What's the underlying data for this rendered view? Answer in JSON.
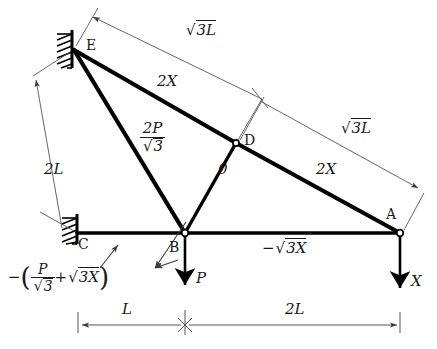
{
  "figure": {
    "type": "truss-free-body-diagram",
    "background": "#ffffff",
    "line_color": "#111111",
    "dim_color": "#444444"
  },
  "nodes": [
    {
      "id": "E",
      "label": "E",
      "x": 73,
      "y": 48,
      "support": "fixed-wall",
      "joint": "wall"
    },
    {
      "id": "D",
      "label": "D",
      "x": 235,
      "y": 142,
      "support": "none",
      "joint": "pin"
    },
    {
      "id": "A",
      "label": "A",
      "x": 400,
      "y": 233,
      "support": "none",
      "joint": "pin"
    },
    {
      "id": "B",
      "label": "B",
      "x": 185,
      "y": 233,
      "support": "none",
      "joint": "pin"
    },
    {
      "id": "C",
      "label": "C",
      "x": 78,
      "y": 233,
      "support": "fixed-wall",
      "joint": "wall"
    }
  ],
  "members": [
    {
      "from": "E",
      "to": "D",
      "force_label": "2X",
      "style": "heavy"
    },
    {
      "from": "D",
      "to": "A",
      "force_label": "2X",
      "style": "heavy"
    },
    {
      "from": "E",
      "to": "B",
      "force_label": "2P/√3",
      "style": "heavy"
    },
    {
      "from": "D",
      "to": "B",
      "force_label": "0",
      "style": "heavy"
    },
    {
      "from": "C",
      "to": "B",
      "force_label": "",
      "style": "heavy"
    },
    {
      "from": "B",
      "to": "A",
      "force_label": "−√3X",
      "style": "heavy"
    }
  ],
  "member_force_labels": {
    "top_left_2x": "2X",
    "top_right_2x": "2X",
    "diagonal_eb_num": "2P",
    "diagonal_eb_den": "3",
    "diagonal_db_zero": "0",
    "bottom_chord_minus": "−",
    "bottom_chord_value": "3X"
  },
  "loads": [
    {
      "at": "B",
      "label": "P",
      "direction": "down"
    },
    {
      "at": "A",
      "label": "X",
      "direction": "down"
    }
  ],
  "reaction": {
    "at": "C",
    "minus_sign": "−",
    "numerator": "P",
    "denominator": "3",
    "plus": "+",
    "second_term": "3X",
    "full_text": "−(P/√3 + √3X)"
  },
  "dimensions": [
    {
      "id": "top-sqrt3L",
      "label": "3L",
      "prefix": "√",
      "from": "E",
      "to": "D",
      "position": "above-left"
    },
    {
      "id": "right-sqrt3L",
      "label": "3L",
      "prefix": "√",
      "from": "D",
      "to": "A",
      "position": "above-right"
    },
    {
      "id": "left-2L",
      "label": "2L",
      "prefix": "",
      "from": "C",
      "to": "E",
      "position": "left"
    },
    {
      "id": "bottom-L",
      "label": "L",
      "prefix": "",
      "from": "C",
      "to": "B",
      "position": "below"
    },
    {
      "id": "bottom-2L",
      "label": "2L",
      "prefix": "",
      "from": "B",
      "to": "A",
      "position": "below"
    }
  ],
  "icons": {
    "wall_hatch": "hatched-wall-support-icon",
    "pin_joint": "pin-joint-circle-icon",
    "arrow_head": "arrow-head-icon"
  }
}
